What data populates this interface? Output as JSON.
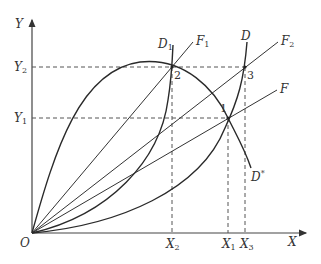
{
  "diagram": {
    "axes": {
      "y_label": "Y",
      "x_label": "X",
      "origin_label": "O"
    },
    "y_ticks": [
      {
        "base": "Y",
        "sub": "2"
      },
      {
        "base": "Y",
        "sub": "1"
      }
    ],
    "x_ticks": [
      {
        "base": "X",
        "sub": "2"
      },
      {
        "base": "X",
        "sub": "1"
      },
      {
        "base": "X",
        "sub": "3"
      }
    ],
    "curves": [
      {
        "base": "D",
        "sub": "1"
      },
      {
        "base": "D",
        "sub": ""
      },
      {
        "base": "D",
        "sub": "*"
      }
    ],
    "rays": [
      {
        "base": "F",
        "sub": "1"
      },
      {
        "base": "F",
        "sub": "2"
      },
      {
        "base": "F",
        "sub": ""
      }
    ],
    "points": [
      "1",
      "2",
      "3"
    ],
    "colors": {
      "line": "#333333",
      "dashed": "#555555"
    }
  }
}
